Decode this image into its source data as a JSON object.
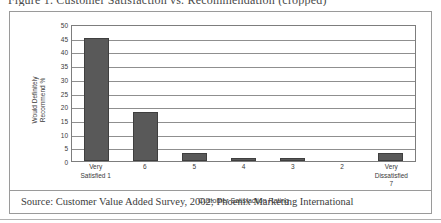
{
  "figure": {
    "caption": "Figure 1. Customer Satisfaction vs. Recommendation  (cropped)",
    "source_note": "Source: Customer Value Added Survey, 2002; Phoenix Marketing International"
  },
  "chart_data": {
    "type": "bar",
    "title": "",
    "categories": [
      "Very\nSatisfied  1",
      "6",
      "5",
      "4",
      "3",
      "2",
      "Very\nDissatisfied\n7"
    ],
    "values": [
      45,
      18,
      3,
      1,
      1,
      0,
      3
    ],
    "xlabel": "Customer Satisfaction Rating",
    "ylabel": "Would Definitely Recommend %",
    "ylabel_lines": [
      "Would Definitely",
      "Recommend %"
    ],
    "ylim": [
      0,
      50
    ],
    "ytick_values": [
      50,
      45,
      40,
      35,
      30,
      25,
      20,
      15,
      10,
      5,
      0
    ],
    "grid": true,
    "legend": "none",
    "bar_color": "#595959",
    "plot_border_color": "#7d7d7d",
    "gridline_color": "#8f8f8f"
  }
}
